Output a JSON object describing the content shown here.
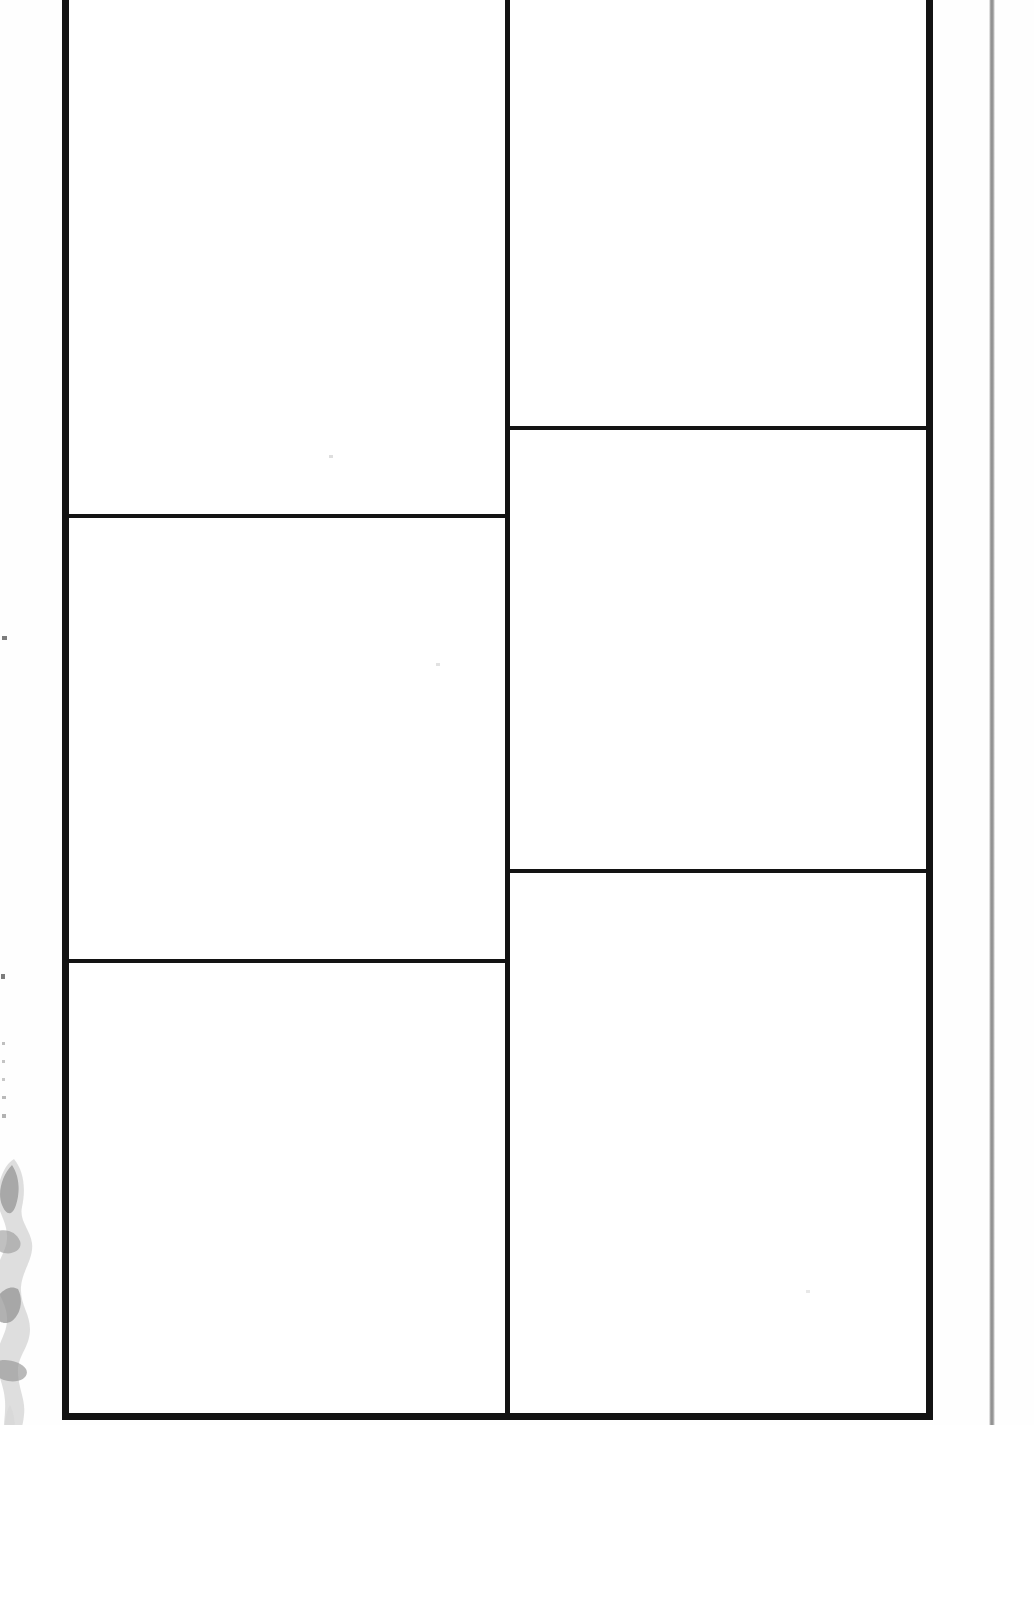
{
  "document": {
    "kind": "scanned-blank-form",
    "title": "Blank gridded form page",
    "page_background": "#ffffff",
    "ink_color": "#131313",
    "artifact_color": "#8c8c8c",
    "width": 1034,
    "height": 1599
  },
  "frame": {
    "name": "outer-table-border",
    "left": 62,
    "right": 933,
    "bottom": 1420,
    "top_cropped": true,
    "border_width_px": 7,
    "note": ""
  },
  "grid": {
    "columns": 2,
    "column_divider_x": 501,
    "left_column": {
      "name": "left-column",
      "rule_y": [
        521,
        966
      ],
      "cells": [
        {
          "id": "cell-left-1",
          "label": "",
          "value": "",
          "row": 1,
          "column": 1
        },
        {
          "id": "cell-left-2",
          "label": "",
          "value": "",
          "row": 2,
          "column": 1
        },
        {
          "id": "cell-left-3",
          "label": "",
          "value": "",
          "row": 3,
          "column": 1
        }
      ]
    },
    "right_column": {
      "name": "right-column",
      "rule_y": [
        433,
        876
      ],
      "cells": [
        {
          "id": "cell-right-1",
          "label": "",
          "value": "",
          "row": 1,
          "column": 2
        },
        {
          "id": "cell-right-2",
          "label": "",
          "value": "",
          "row": 2,
          "column": 2
        },
        {
          "id": "cell-right-3",
          "label": "",
          "value": "",
          "row": 3,
          "column": 2
        }
      ]
    }
  },
  "artifacts": {
    "right_edge_line": {
      "name": "scan-edge-line",
      "x": 992,
      "color": "#8c8c8c",
      "description": ""
    },
    "left_smudge": {
      "name": "scan-smudge",
      "x": 0,
      "y": 1160,
      "color": "#b9b9b9",
      "description": ""
    },
    "specks": [
      {
        "x": 3,
        "y": 637
      },
      {
        "x": 2,
        "y": 975
      },
      {
        "x": 2,
        "y": 1043
      },
      {
        "x": 2,
        "y": 1061
      },
      {
        "x": 2,
        "y": 1079
      },
      {
        "x": 2,
        "y": 1097
      },
      {
        "x": 2,
        "y": 1115
      }
    ]
  },
  "footer": {
    "name": "page-footer-blank",
    "text": ""
  }
}
